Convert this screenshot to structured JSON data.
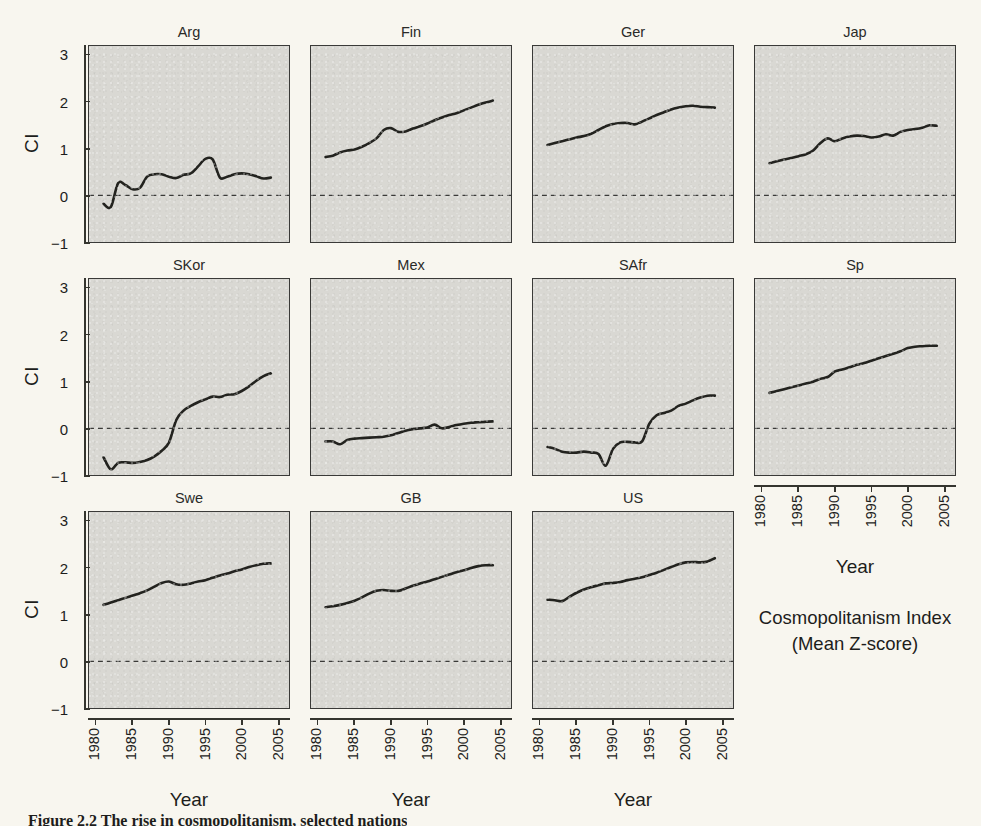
{
  "figure": {
    "ylabel": "CI",
    "xlabel": "Year",
    "note_line1": "Cosmopolitanism Index",
    "note_line2": "(Mean Z-score)",
    "caption": "Figure 2.2 The rise in cosmopolitanism, selected nations"
  },
  "axis": {
    "y_ticks": [
      "3",
      "2",
      "1",
      "0",
      "-1"
    ],
    "x_ticks": [
      "1980",
      "1985",
      "1990",
      "1995",
      "2000",
      "2005"
    ]
  },
  "colors": {
    "page_background": "#f8f6ef",
    "panel_background": "#d9d8d3",
    "panel_border": "#3a3a38",
    "line": "#23231f",
    "zero_line": "#3a3a38",
    "text": "#1d1d1b"
  },
  "panels": [
    {
      "label": "Arg"
    },
    {
      "label": "Fin"
    },
    {
      "label": "Ger"
    },
    {
      "label": "Jap"
    },
    {
      "label": "SKor"
    },
    {
      "label": "Mex"
    },
    {
      "label": "SAfr"
    },
    {
      "label": "Sp"
    },
    {
      "label": "Swe"
    },
    {
      "label": "GB"
    },
    {
      "label": "US"
    }
  ],
  "chart_data": {
    "type": "line",
    "xlabel": "Year",
    "ylabel": "CI",
    "xlim": [
      1979.0,
      2006.5
    ],
    "ylim": [
      -1,
      3.2
    ],
    "x_ticks": [
      1980,
      1985,
      1990,
      1995,
      2000,
      2005
    ],
    "y_ticks": [
      -1,
      0,
      1,
      2,
      3
    ],
    "grid": false,
    "legend": "none",
    "annotations": [
      {
        "text": "zero reference line",
        "type": "hline",
        "y": 0,
        "style": "dashed"
      }
    ],
    "layout": {
      "rows": 3,
      "cols": 4,
      "panel_order": [
        "Arg",
        "Fin",
        "Ger",
        "Jap",
        "SKor",
        "Mex",
        "SAfr",
        "Sp",
        "Swe",
        "GB",
        "US"
      ]
    },
    "series": [
      {
        "name": "Arg",
        "x": [
          1981,
          1982,
          1983,
          1984,
          1985,
          1986,
          1987,
          1988,
          1989,
          1990,
          1991,
          1992,
          1993,
          1994,
          1995,
          1996,
          1997,
          1998,
          1999,
          2000,
          2001,
          2002,
          2003,
          2004
        ],
        "y": [
          -0.18,
          -0.25,
          0.26,
          0.22,
          0.13,
          0.16,
          0.4,
          0.45,
          0.45,
          0.4,
          0.37,
          0.44,
          0.47,
          0.62,
          0.78,
          0.77,
          0.38,
          0.4,
          0.45,
          0.47,
          0.45,
          0.41,
          0.36,
          0.38
        ]
      },
      {
        "name": "Fin",
        "x": [
          1981,
          1982,
          1983,
          1984,
          1985,
          1986,
          1987,
          1988,
          1989,
          1990,
          1991,
          1992,
          1993,
          1994,
          1995,
          1996,
          1997,
          1998,
          1999,
          2000,
          2001,
          2002,
          2003,
          2004
        ],
        "y": [
          0.82,
          0.85,
          0.92,
          0.96,
          0.98,
          1.04,
          1.12,
          1.22,
          1.4,
          1.44,
          1.36,
          1.37,
          1.43,
          1.48,
          1.54,
          1.61,
          1.67,
          1.72,
          1.76,
          1.82,
          1.88,
          1.94,
          1.99,
          2.03
        ]
      },
      {
        "name": "Ger",
        "x": [
          1981,
          1982,
          1983,
          1984,
          1985,
          1986,
          1987,
          1988,
          1989,
          1990,
          1991,
          1992,
          1993,
          1994,
          1995,
          1996,
          1997,
          1998,
          1999,
          2000,
          2001,
          2002,
          2003,
          2004
        ],
        "y": [
          1.08,
          1.12,
          1.16,
          1.2,
          1.24,
          1.27,
          1.32,
          1.4,
          1.48,
          1.53,
          1.55,
          1.55,
          1.52,
          1.58,
          1.65,
          1.72,
          1.78,
          1.84,
          1.88,
          1.91,
          1.92,
          1.9,
          1.89,
          1.88
        ]
      },
      {
        "name": "Jap",
        "x": [
          1981,
          1982,
          1983,
          1984,
          1985,
          1986,
          1987,
          1988,
          1989,
          1990,
          1991,
          1992,
          1993,
          1994,
          1995,
          1996,
          1997,
          1998,
          1999,
          2000,
          2001,
          2002,
          2003,
          2004
        ],
        "y": [
          0.69,
          0.73,
          0.77,
          0.8,
          0.84,
          0.88,
          0.96,
          1.12,
          1.22,
          1.16,
          1.22,
          1.26,
          1.28,
          1.27,
          1.24,
          1.26,
          1.31,
          1.28,
          1.36,
          1.4,
          1.42,
          1.45,
          1.5,
          1.49
        ]
      },
      {
        "name": "SKor",
        "x": [
          1981,
          1982,
          1983,
          1984,
          1985,
          1986,
          1987,
          1988,
          1989,
          1990,
          1991,
          1992,
          1993,
          1994,
          1995,
          1996,
          1997,
          1998,
          1999,
          2000,
          2001,
          2002,
          2003,
          2004
        ],
        "y": [
          -0.62,
          -0.88,
          -0.74,
          -0.73,
          -0.74,
          -0.72,
          -0.68,
          -0.6,
          -0.48,
          -0.3,
          0.18,
          0.38,
          0.48,
          0.56,
          0.62,
          0.68,
          0.67,
          0.72,
          0.73,
          0.8,
          0.9,
          1.02,
          1.12,
          1.18
        ]
      },
      {
        "name": "Mex",
        "x": [
          1981,
          1982,
          1983,
          1984,
          1985,
          1986,
          1987,
          1988,
          1989,
          1990,
          1991,
          1992,
          1993,
          1994,
          1995,
          1996,
          1997,
          1998,
          1999,
          2000,
          2001,
          2002,
          2003,
          2004
        ],
        "y": [
          -0.28,
          -0.28,
          -0.34,
          -0.25,
          -0.22,
          -0.21,
          -0.2,
          -0.19,
          -0.18,
          -0.15,
          -0.1,
          -0.05,
          -0.02,
          0.0,
          0.02,
          0.08,
          0.0,
          0.03,
          0.07,
          0.1,
          0.12,
          0.13,
          0.14,
          0.15
        ]
      },
      {
        "name": "SAfr",
        "x": [
          1981,
          1982,
          1983,
          1984,
          1985,
          1986,
          1987,
          1988,
          1989,
          1990,
          1991,
          1992,
          1993,
          1994,
          1995,
          1996,
          1997,
          1998,
          1999,
          2000,
          2001,
          2002,
          2003,
          2004
        ],
        "y": [
          -0.4,
          -0.44,
          -0.5,
          -0.52,
          -0.52,
          -0.5,
          -0.52,
          -0.55,
          -0.8,
          -0.44,
          -0.3,
          -0.29,
          -0.3,
          -0.28,
          0.1,
          0.28,
          0.33,
          0.38,
          0.48,
          0.53,
          0.6,
          0.66,
          0.7,
          0.7
        ]
      },
      {
        "name": "Sp",
        "x": [
          1981,
          1982,
          1983,
          1984,
          1985,
          1986,
          1987,
          1988,
          1989,
          1990,
          1991,
          1992,
          1993,
          1994,
          1995,
          1996,
          1997,
          1998,
          1999,
          2000,
          2001,
          2002,
          2003,
          2004
        ],
        "y": [
          0.76,
          0.8,
          0.84,
          0.88,
          0.92,
          0.96,
          1.0,
          1.06,
          1.1,
          1.22,
          1.26,
          1.31,
          1.36,
          1.4,
          1.45,
          1.5,
          1.55,
          1.6,
          1.65,
          1.72,
          1.75,
          1.76,
          1.77,
          1.77
        ]
      },
      {
        "name": "Swe",
        "x": [
          1981,
          1982,
          1983,
          1984,
          1985,
          1986,
          1987,
          1988,
          1989,
          1990,
          1991,
          1992,
          1993,
          1994,
          1995,
          1996,
          1997,
          1998,
          1999,
          2000,
          2001,
          2002,
          2003,
          2004
        ],
        "y": [
          1.21,
          1.26,
          1.31,
          1.36,
          1.41,
          1.46,
          1.52,
          1.6,
          1.68,
          1.71,
          1.65,
          1.64,
          1.67,
          1.71,
          1.74,
          1.79,
          1.84,
          1.88,
          1.93,
          1.97,
          2.02,
          2.06,
          2.09,
          2.1
        ]
      },
      {
        "name": "GB",
        "x": [
          1981,
          1982,
          1983,
          1984,
          1985,
          1986,
          1987,
          1988,
          1989,
          1990,
          1991,
          1992,
          1993,
          1994,
          1995,
          1996,
          1997,
          1998,
          1999,
          2000,
          2001,
          2002,
          2003,
          2004
        ],
        "y": [
          1.16,
          1.18,
          1.21,
          1.25,
          1.3,
          1.37,
          1.45,
          1.51,
          1.53,
          1.51,
          1.51,
          1.56,
          1.62,
          1.67,
          1.71,
          1.76,
          1.81,
          1.86,
          1.91,
          1.95,
          2.0,
          2.04,
          2.06,
          2.06
        ]
      },
      {
        "name": "US",
        "x": [
          1981,
          1982,
          1983,
          1984,
          1985,
          1986,
          1987,
          1988,
          1989,
          1990,
          1991,
          1992,
          1993,
          1994,
          1995,
          1996,
          1997,
          1998,
          1999,
          2000,
          2001,
          2002,
          2003,
          2004
        ],
        "y": [
          1.32,
          1.31,
          1.29,
          1.38,
          1.47,
          1.54,
          1.59,
          1.63,
          1.67,
          1.68,
          1.7,
          1.74,
          1.77,
          1.8,
          1.85,
          1.9,
          1.96,
          2.02,
          2.08,
          2.12,
          2.13,
          2.12,
          2.14,
          2.21
        ]
      }
    ]
  }
}
